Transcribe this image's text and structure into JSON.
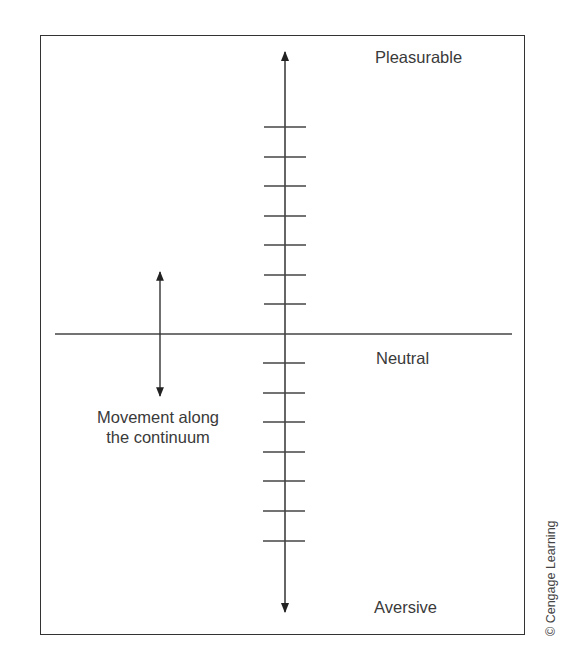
{
  "figure": {
    "labels": {
      "top": "Pleasurable",
      "middle": "Neutral",
      "bottom": "Aversive",
      "movement_line1": "Movement along",
      "movement_line2": "the continuum"
    },
    "credit": "© Cengage Learning",
    "colors": {
      "line": "#333333",
      "text": "#3a3a3a",
      "background": "#ffffff"
    },
    "axis": {
      "orientation": "vertical",
      "ticks_above_neutral": 7,
      "ticks_below_neutral": 7,
      "arrowheads": [
        "top",
        "bottom"
      ]
    }
  }
}
